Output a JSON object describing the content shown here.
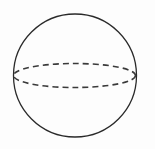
{
  "diagram": {
    "type": "sphere",
    "stroke_color": "#2a2a2a",
    "background": "#fdfdfd",
    "outline": {
      "cx": 75,
      "cy": 75.5,
      "r": 61.5
    },
    "equator": {
      "cx": 74.5,
      "cy": 75.5,
      "rx": 61,
      "ry": 12,
      "style": "dashed"
    }
  }
}
